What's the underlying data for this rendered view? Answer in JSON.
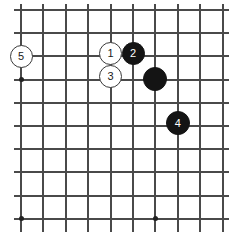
{
  "figure": {
    "kind": "go-board-diagram",
    "width": 232,
    "height": 239,
    "background_color": "#ffffff",
    "line_color": "#4a4a4a",
    "black_stone_color": "#141414",
    "white_stone_color": "#ffffff",
    "white_stone_border_color": "#3a3a3a",
    "black_label_color": "#ffffff",
    "white_label_color": "#1a1a1a"
  },
  "board": {
    "vertical_line_count": 10,
    "horizontal_line_count": 10,
    "vertical_line_x": [
      21,
      43.4,
      65.8,
      88.2,
      110.6,
      133,
      155.4,
      177.8,
      200.2,
      222.6
    ],
    "horizontal_line_y": [
      10,
      33.2,
      56.4,
      79.6,
      102.8,
      126,
      149.2,
      172.4,
      195.6,
      218.8
    ],
    "vertical_extent": {
      "top": 4,
      "bottom": 232
    },
    "horizontal_extent": {
      "left": 14,
      "right": 229
    },
    "star_points": [
      {
        "x": 21,
        "y": 79.6
      },
      {
        "x": 21,
        "y": 218.8
      },
      {
        "x": 155.4,
        "y": 218.8
      }
    ]
  },
  "stones": [
    {
      "id": "stone-5",
      "label": "5",
      "color": "white",
      "x": 21,
      "y": 56.4,
      "radius": 11.5
    },
    {
      "id": "stone-1",
      "label": "1",
      "color": "white",
      "x": 110.6,
      "y": 53.5,
      "radius": 11.5
    },
    {
      "id": "stone-2",
      "label": "2",
      "color": "black",
      "x": 133,
      "y": 53.5,
      "radius": 11.5
    },
    {
      "id": "stone-3",
      "label": "3",
      "color": "white",
      "x": 110.6,
      "y": 76,
      "radius": 11.5
    },
    {
      "id": "stone-black-unmarked",
      "label": "",
      "color": "black",
      "x": 155.4,
      "y": 78.5,
      "radius": 12
    },
    {
      "id": "stone-4",
      "label": "4",
      "color": "black",
      "x": 177.8,
      "y": 123,
      "radius": 12
    }
  ]
}
